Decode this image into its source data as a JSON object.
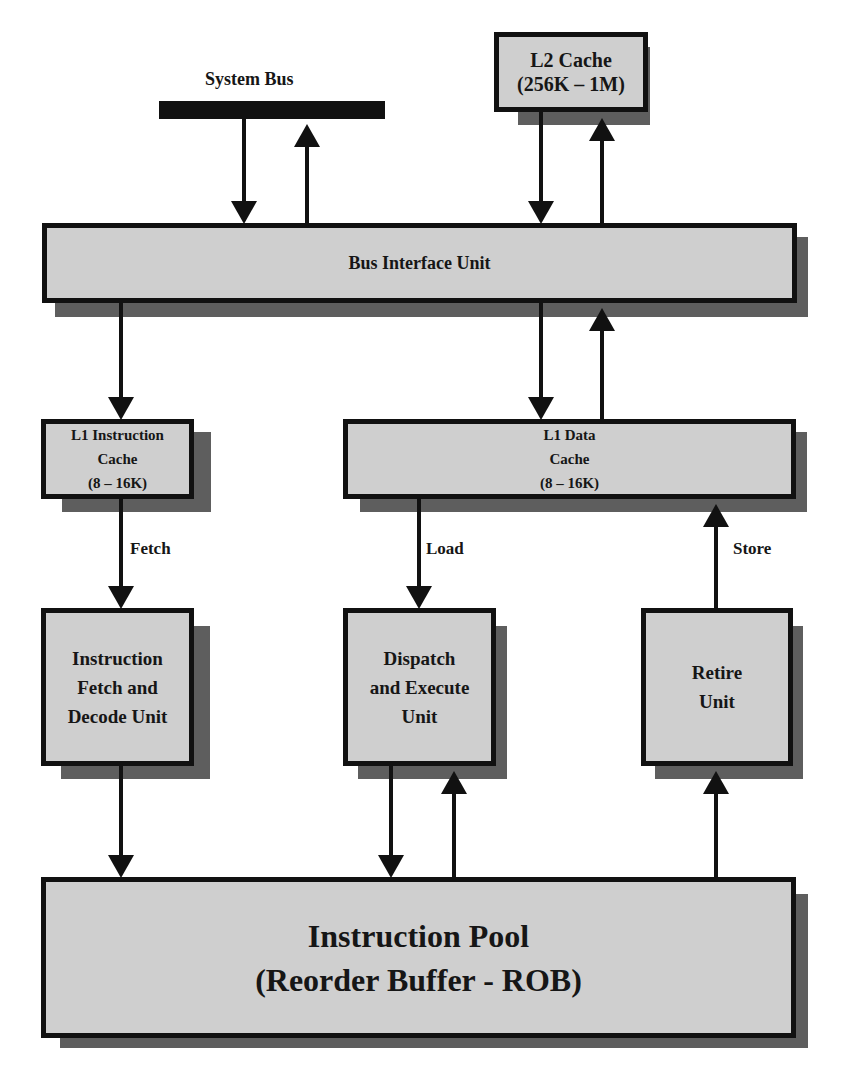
{
  "diagram": {
    "colors": {
      "box_fill": "#cfcfcf",
      "box_border": "#111111",
      "shadow": "#5e5e5e",
      "background": "#ffffff"
    },
    "system_bus": {
      "label": "System Bus"
    },
    "l2_cache": {
      "line1": "L2 Cache",
      "line2": "(256K – 1M)"
    },
    "bus_interface_unit": {
      "label": "Bus Interface Unit"
    },
    "l1_instruction_cache": {
      "line1": "L1 Instruction",
      "line2": "Cache",
      "line3": "(8 – 16K)"
    },
    "l1_data_cache": {
      "line1": "L1 Data",
      "line2": "Cache",
      "line3": "(8 – 16K)"
    },
    "fetch_decode_unit": {
      "line1": "Instruction",
      "line2": "Fetch and",
      "line3": "Decode Unit"
    },
    "dispatch_execute_unit": {
      "line1": "Dispatch",
      "line2": "and Execute",
      "line3": "Unit"
    },
    "retire_unit": {
      "line1": "Retire",
      "line2": "Unit"
    },
    "instruction_pool": {
      "line1": "Instruction Pool",
      "line2": "(Reorder Buffer - ROB)"
    },
    "edge_labels": {
      "fetch": "Fetch",
      "load": "Load",
      "store": "Store"
    },
    "connections": [
      {
        "from": "System Bus",
        "to": "Bus Interface Unit"
      },
      {
        "from": "Bus Interface Unit",
        "to": "System Bus"
      },
      {
        "from": "L2 Cache",
        "to": "Bus Interface Unit"
      },
      {
        "from": "Bus Interface Unit",
        "to": "L2 Cache"
      },
      {
        "from": "Bus Interface Unit",
        "to": "L1 Instruction Cache"
      },
      {
        "from": "Bus Interface Unit",
        "to": "L1 Data Cache"
      },
      {
        "from": "L1 Data Cache",
        "to": "Bus Interface Unit"
      },
      {
        "from": "L1 Instruction Cache",
        "to": "Instruction Fetch and Decode Unit",
        "label": "Fetch"
      },
      {
        "from": "L1 Data Cache",
        "to": "Dispatch and Execute Unit",
        "label": "Load"
      },
      {
        "from": "Retire Unit",
        "to": "L1 Data Cache",
        "label": "Store"
      },
      {
        "from": "Instruction Fetch and Decode Unit",
        "to": "Instruction Pool"
      },
      {
        "from": "Dispatch and Execute Unit",
        "to": "Instruction Pool"
      },
      {
        "from": "Instruction Pool",
        "to": "Dispatch and Execute Unit"
      },
      {
        "from": "Instruction Pool",
        "to": "Retire Unit"
      }
    ]
  }
}
